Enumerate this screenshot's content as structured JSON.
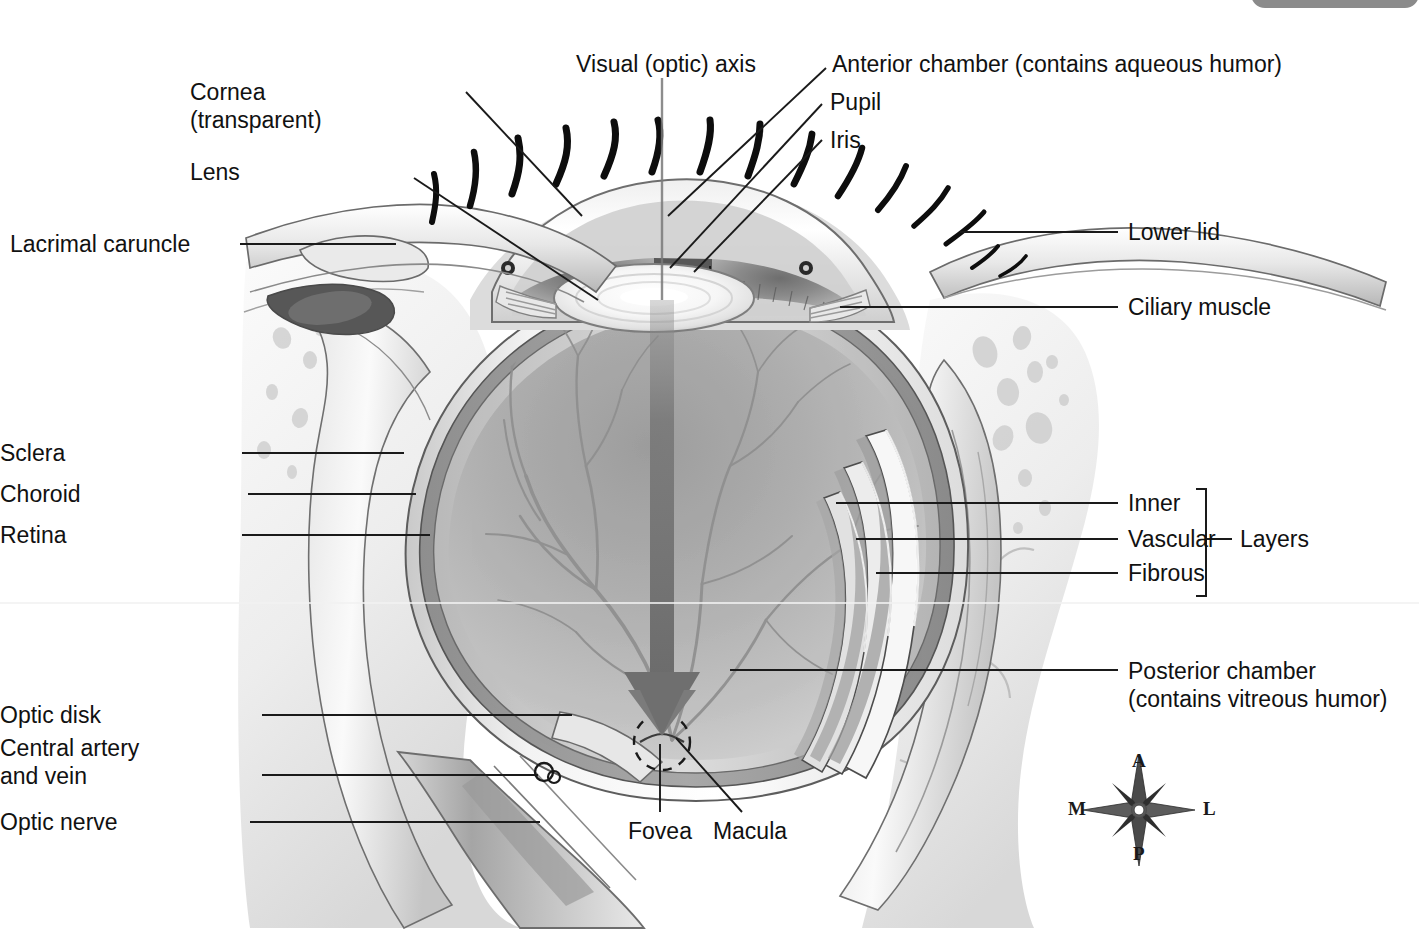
{
  "figure": {
    "background": "#ffffff",
    "line_color": "#1a1a1a",
    "text_color": "#111111",
    "corner_tab_color": "#8b8b8b"
  },
  "labels": {
    "visual_axis": "Visual (optic) axis",
    "cornea_line1": "Cornea",
    "cornea_line2": "(transparent)",
    "lens": "Lens",
    "lacrimal_caruncle": "Lacrimal caruncle",
    "anterior_chamber": "Anterior chamber (contains aqueous humor)",
    "pupil": "Pupil",
    "iris": "Iris",
    "lower_lid": "Lower lid",
    "ciliary_muscle": "Ciliary muscle",
    "sclera": "Sclera",
    "choroid": "Choroid",
    "retina": "Retina",
    "inner": "Inner",
    "vascular": "Vascular",
    "fibrous": "Fibrous",
    "layers": "Layers",
    "posterior_chamber_line1": "Posterior chamber",
    "posterior_chamber_line2": "(contains vitreous humor)",
    "optic_disk": "Optic disk",
    "central_artery_line1": "Central artery",
    "central_artery_line2": "and vein",
    "optic_nerve": "Optic nerve",
    "fovea": "Fovea",
    "macula": "Macula"
  },
  "compass": {
    "anterior": "A",
    "posterior": "P",
    "medial": "M",
    "lateral": "L"
  }
}
